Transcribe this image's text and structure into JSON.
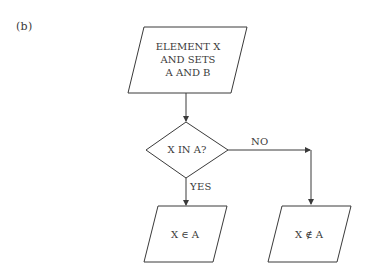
{
  "figure_label": "(b)",
  "nodes": {
    "input": {
      "lines": [
        "ELEMENT X",
        "AND SETS",
        "A AND B"
      ],
      "shape": "parallelogram"
    },
    "decision": {
      "text": "X IN A?",
      "shape": "diamond"
    },
    "yes_output": {
      "text": "X ∈ A",
      "shape": "parallelogram"
    },
    "no_output": {
      "text": "X ∉ A",
      "shape": "parallelogram"
    }
  },
  "edges": {
    "yes_label": "YES",
    "no_label": "NO"
  },
  "colors": {
    "stroke": "#3a3a3a",
    "background": "#ffffff"
  }
}
